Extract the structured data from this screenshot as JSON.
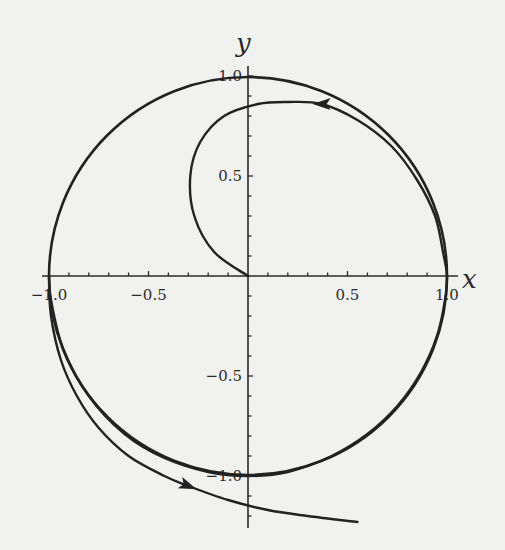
{
  "chart_data": {
    "type": "line",
    "title": "",
    "xlabel": "x",
    "ylabel": "y",
    "xlim": [
      -1.0,
      1.0
    ],
    "ylim": [
      -1.25,
      1.0
    ],
    "grid": false,
    "legend": null,
    "x_ticks": [
      -1.0,
      -0.5,
      0.5,
      1.0
    ],
    "x_tick_labels": [
      "−1.0",
      "−0.5",
      "0.5",
      "1.0"
    ],
    "y_ticks": [
      1.0,
      0.5,
      -0.5,
      -1.0
    ],
    "y_tick_labels": [
      "1.0",
      "0.5",
      "−0.5",
      "−1.0"
    ],
    "minor_tick_step": 0.1,
    "series": [
      {
        "name": "unit circle",
        "kind": "curve",
        "equation": "x^2 + y^2 = 1",
        "center": [
          0,
          0
        ],
        "radius": 1.0
      },
      {
        "name": "trajectory",
        "kind": "curve",
        "points": [
          [
            0.0,
            0.0
          ],
          [
            -0.17,
            0.12
          ],
          [
            -0.27,
            0.3
          ],
          [
            -0.29,
            0.5
          ],
          [
            -0.24,
            0.67
          ],
          [
            -0.12,
            0.8
          ],
          [
            0.05,
            0.86
          ],
          [
            0.2,
            0.87
          ],
          [
            0.37,
            0.86
          ],
          [
            0.55,
            0.78
          ],
          [
            0.72,
            0.65
          ],
          [
            0.85,
            0.48
          ],
          [
            0.94,
            0.3
          ],
          [
            0.98,
            0.12
          ],
          [
            1.0,
            0.0
          ],
          [
            0.99,
            -0.12
          ],
          [
            0.95,
            -0.3
          ],
          [
            0.87,
            -0.48
          ],
          [
            0.75,
            -0.65
          ],
          [
            0.6,
            -0.79
          ],
          [
            0.42,
            -0.9
          ],
          [
            0.2,
            -0.98
          ],
          [
            0.0,
            -1.0
          ],
          [
            -0.2,
            -0.98
          ],
          [
            -0.42,
            -0.91
          ],
          [
            -0.62,
            -0.79
          ],
          [
            -0.8,
            -0.6
          ],
          [
            -0.93,
            -0.36
          ],
          [
            -0.99,
            -0.12
          ],
          [
            -1.0,
            0.0
          ],
          [
            -0.99,
            -0.2
          ],
          [
            -0.94,
            -0.42
          ],
          [
            -0.86,
            -0.6
          ],
          [
            -0.75,
            -0.76
          ],
          [
            -0.6,
            -0.9
          ],
          [
            -0.42,
            -1.0
          ],
          [
            -0.3,
            -1.05
          ],
          [
            -0.1,
            -1.12
          ],
          [
            0.1,
            -1.17
          ],
          [
            0.3,
            -1.2
          ],
          [
            0.55,
            -1.23
          ]
        ],
        "arrows": [
          {
            "at": [
              0.37,
              0.86
            ],
            "direction": "left"
          },
          {
            "at": [
              -0.3,
              -1.05
            ],
            "direction": "right-down"
          }
        ]
      }
    ]
  },
  "axes": {
    "x_label": "x",
    "y_label": "y"
  }
}
